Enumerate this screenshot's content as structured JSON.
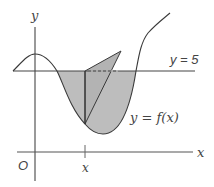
{
  "diagram": {
    "axes": {
      "x_label": "x",
      "y_label": "y",
      "origin_label": "O"
    },
    "tick": {
      "label": "x"
    },
    "lines": {
      "horizontal_label": "y = 5"
    },
    "curve": {
      "label": "y = f(x)"
    },
    "colors": {
      "stroke": "#3a3a3a",
      "shade": "#bfbfbf",
      "label": "#444444"
    }
  }
}
